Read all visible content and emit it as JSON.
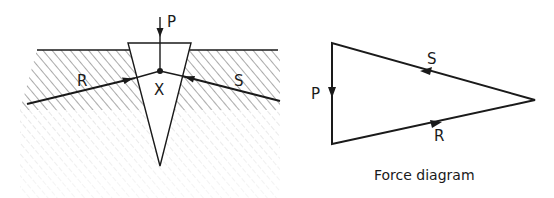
{
  "wedge_diagram": {
    "labels": {
      "applied_force": "P",
      "left_reaction": "R",
      "right_reaction": "S",
      "joint": "X"
    }
  },
  "force_diagram": {
    "caption": "Force diagram",
    "labels": {
      "p": "P",
      "s": "S",
      "r": "R"
    }
  },
  "colors": {
    "ink": "#1a1a1a",
    "hatch": "#555555",
    "background": "#ffffff"
  }
}
